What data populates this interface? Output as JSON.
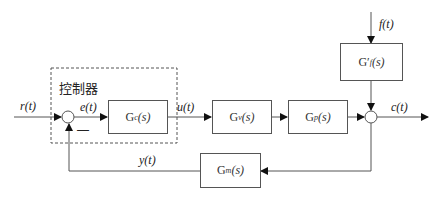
{
  "controller_label": "控制器",
  "signals": {
    "r": "r(t)",
    "e": "e(t)",
    "u": "u(t)",
    "c": "c(t)",
    "y": "y(t)",
    "f": "f(t)"
  },
  "blocks": {
    "gc": {
      "name": "G",
      "sub": "c",
      "arg": "(s)"
    },
    "gv": {
      "name": "G",
      "sub": "v",
      "arg": "(s)"
    },
    "gp": {
      "name": "G",
      "sub": "p",
      "arg": "(s)"
    },
    "gf": {
      "name": "G′",
      "sub": "f",
      "arg": "(s)"
    },
    "gm": {
      "name": "G",
      "sub": "m",
      "arg": "(s)"
    }
  },
  "feedback_sign": "—"
}
